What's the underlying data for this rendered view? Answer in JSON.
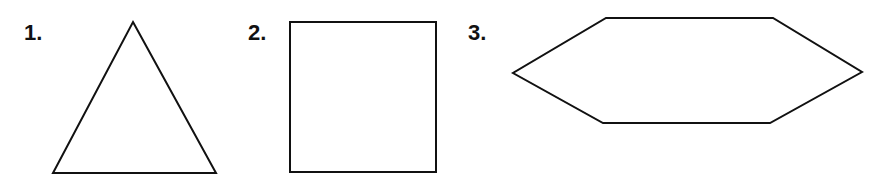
{
  "page": {
    "background_color": "#ffffff",
    "stroke_color": "#111111",
    "fill_color": "#ffffff",
    "width": 896,
    "height": 178
  },
  "items": [
    {
      "label": "1.",
      "shape_name": "triangle",
      "sides": 3,
      "points": "133,22 216,173 53,173",
      "label_position": {
        "x": 24,
        "y": 22
      }
    },
    {
      "label": "2.",
      "shape_name": "square",
      "sides": 4,
      "points": "50,22 196,22 196,172 50,172",
      "label_position": {
        "x": 8,
        "y": 22
      }
    },
    {
      "label": "3.",
      "shape_name": "hexagon",
      "sides": 6,
      "points": "146,18 313,18 402,72 310,123 143,123 53,73",
      "label_position": {
        "x": 8,
        "y": 22
      }
    }
  ]
}
